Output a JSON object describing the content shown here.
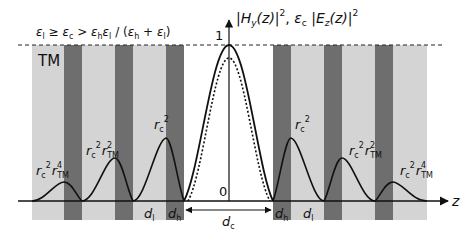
{
  "figure": {
    "condition": "εl ≥ εc > εh εl / (εh + εl)",
    "condition_parts": {
      "lhs": "ε",
      "lhs_sub": "l",
      "ge": " ≥ ",
      "mid": "ε",
      "mid_sub": "c",
      "gt": " > ",
      "r1": "ε",
      "r1_sub": "h",
      "r2": "ε",
      "r2_sub": "l",
      "slash": " / (",
      "r3": "ε",
      "r3_sub": "h",
      "plus": " + ",
      "r4": "ε",
      "r4_sub": "l",
      "close": ")"
    },
    "polarization": "TM",
    "y_axis_label": "|Hy(z)|², εc|Ez(z)|²",
    "y_axis_parts": {
      "h": "H",
      "h_sub": "y",
      "h_arg": "(z)",
      "sep": ", ",
      "eps": "ε",
      "eps_sub": "c",
      "e": "E",
      "e_sub": "z",
      "e_arg": "(z)",
      "sq": "2"
    },
    "tick_one": "1",
    "tick_zero": "0",
    "x_axis_label": "z",
    "peak_labels": {
      "rc": "r",
      "rc_sub": "c",
      "rtm": "r",
      "rtm_sub": "TM",
      "sq": "2",
      "p4": "4"
    },
    "layer_labels": {
      "d": "d",
      "l": "l",
      "h": "h",
      "c": "c"
    },
    "colors": {
      "light_layer": "#d4d4d4",
      "dark_layer": "#6e6e6e",
      "core": "#ffffff",
      "curve": "#111111"
    }
  }
}
